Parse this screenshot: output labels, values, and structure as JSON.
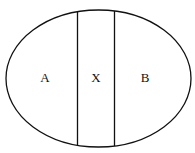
{
  "diagram": {
    "type": "ellipse-partitioned",
    "regions": [
      {
        "id": "left",
        "label": "A"
      },
      {
        "id": "middle",
        "label": "X"
      },
      {
        "id": "right",
        "label": "B"
      }
    ],
    "colors": {
      "stroke": "#111111",
      "background": "#ffffff"
    }
  }
}
